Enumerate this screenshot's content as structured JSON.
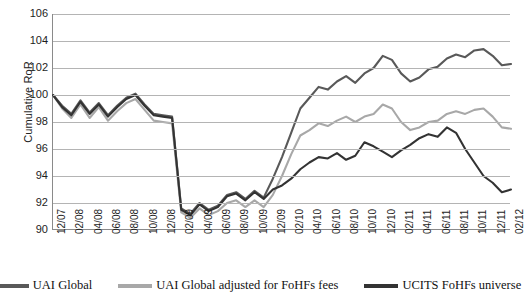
{
  "chart_data": {
    "type": "line",
    "title": "",
    "xlabel": "",
    "ylabel": "Cumulative RoR",
    "ylim": [
      90,
      106
    ],
    "ytick_step": 2,
    "yticks": [
      106,
      104,
      102,
      100,
      98,
      96,
      94,
      92,
      90
    ],
    "grid": true,
    "legend_position": "bottom",
    "categories": [
      "12/07",
      "01/08",
      "02/08",
      "03/08",
      "04/08",
      "05/08",
      "06/08",
      "07/08",
      "08/08",
      "09/08",
      "10/08",
      "11/08",
      "12/08",
      "01/09",
      "02/09",
      "03/09",
      "04/09",
      "05/09",
      "06/09",
      "07/09",
      "08/09",
      "09/09",
      "10/09",
      "11/09",
      "12/09",
      "01/10",
      "02/10",
      "03/10",
      "04/10",
      "05/10",
      "06/10",
      "07/10",
      "08/10",
      "09/10",
      "10/10",
      "11/10",
      "12/10",
      "01/11",
      "02/11",
      "03/11",
      "04/11",
      "05/11",
      "06/11",
      "07/11",
      "08/11",
      "09/11",
      "10/11",
      "11/11",
      "12/11",
      "01/12",
      "02/12"
    ],
    "xtick_labels": [
      "12/07",
      "02/08",
      "04/08",
      "06/08",
      "08/08",
      "10/08",
      "12/08",
      "02/09",
      "04/09",
      "06/09",
      "08/09",
      "10/09",
      "12/09",
      "02/10",
      "04/10",
      "06/10",
      "08/10",
      "10/10",
      "12/10",
      "02/11",
      "04/11",
      "06/11",
      "08/11",
      "10/11",
      "12/11",
      "02/12"
    ],
    "series": [
      {
        "name": "UAI Global",
        "color": "#595959",
        "values": [
          100.0,
          99.2,
          98.6,
          99.6,
          98.7,
          99.4,
          98.5,
          99.2,
          99.8,
          100.1,
          99.3,
          98.6,
          98.5,
          98.4,
          91.6,
          91.2,
          92.0,
          91.5,
          91.8,
          92.6,
          92.8,
          92.3,
          92.9,
          92.4,
          93.8,
          95.4,
          97.2,
          99.0,
          99.8,
          100.6,
          100.4,
          101.0,
          101.4,
          100.9,
          101.6,
          102.0,
          102.9,
          102.6,
          101.6,
          101.0,
          101.3,
          101.9,
          102.1,
          102.7,
          103.0,
          102.8,
          103.3,
          103.4,
          102.9,
          102.2,
          102.3
        ]
      },
      {
        "name": "UAI Global adjusted for FoHFs fees",
        "color": "#a8a8a8",
        "values": [
          100.0,
          99.0,
          98.3,
          99.3,
          98.3,
          99.1,
          98.1,
          98.8,
          99.4,
          99.7,
          98.9,
          98.1,
          98.0,
          97.9,
          91.3,
          90.9,
          91.6,
          91.1,
          91.4,
          92.0,
          92.2,
          91.7,
          92.2,
          91.7,
          92.6,
          94.0,
          95.6,
          97.0,
          97.4,
          97.9,
          97.7,
          98.1,
          98.4,
          98.0,
          98.4,
          98.6,
          99.3,
          99.0,
          98.0,
          97.4,
          97.6,
          98.0,
          98.1,
          98.6,
          98.8,
          98.6,
          98.9,
          99.0,
          98.4,
          97.6,
          97.5
        ]
      },
      {
        "name": "UCITS FoHFs universe",
        "color": "#333333",
        "values": [
          100.0,
          99.1,
          98.5,
          99.5,
          98.6,
          99.3,
          98.4,
          99.1,
          99.7,
          100.0,
          99.2,
          98.5,
          98.4,
          98.3,
          91.5,
          91.1,
          91.9,
          91.4,
          91.7,
          92.5,
          92.7,
          92.2,
          92.8,
          92.3,
          93.0,
          93.3,
          93.8,
          94.5,
          95.0,
          95.4,
          95.3,
          95.7,
          95.2,
          95.5,
          96.5,
          96.2,
          95.8,
          95.4,
          95.9,
          96.3,
          96.8,
          97.1,
          96.9,
          97.6,
          97.2,
          96.0,
          95.0,
          94.0,
          93.5,
          92.8,
          93.0
        ]
      }
    ]
  },
  "legend": {
    "items": [
      {
        "label": "UAI Global",
        "color": "#595959"
      },
      {
        "label": "UAI Global adjusted for FoHFs fees",
        "color": "#a8a8a8"
      },
      {
        "label": "UCITS FoHFs universe",
        "color": "#333333"
      }
    ]
  }
}
